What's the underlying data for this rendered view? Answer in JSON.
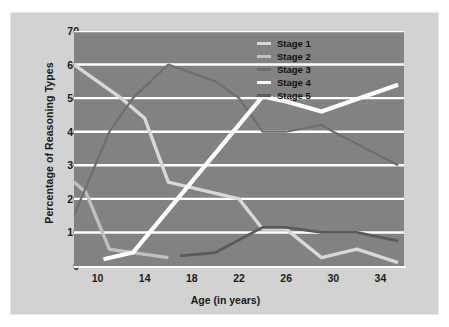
{
  "chart_data": {
    "type": "line",
    "title": "",
    "xlabel": "Age (in years)",
    "ylabel": "Percentage of Reasoning Types",
    "xlim": [
      8,
      36
    ],
    "ylim": [
      0,
      70
    ],
    "xticks": [
      10,
      14,
      18,
      22,
      26,
      30,
      34
    ],
    "yticks": [
      0,
      10,
      20,
      30,
      40,
      50,
      60,
      70
    ],
    "grid": "horizontal",
    "legend_position": "top-right",
    "series": [
      {
        "name": "Stage 1",
        "color": "#d8d8d8",
        "points": [
          [
            8,
            60
          ],
          [
            12,
            50
          ],
          [
            14,
            44
          ],
          [
            16,
            25
          ],
          [
            22,
            20
          ],
          [
            24,
            11
          ],
          [
            26,
            11
          ],
          [
            29,
            2.5
          ],
          [
            32,
            5
          ],
          [
            35.5,
            1
          ]
        ]
      },
      {
        "name": "Stage 2",
        "color": "#c0c0c0",
        "points": [
          [
            8,
            25
          ],
          [
            9,
            22
          ],
          [
            11,
            5
          ],
          [
            13,
            4
          ],
          [
            16,
            2.5
          ]
        ]
      },
      {
        "name": "Stage 3",
        "color": "#6e6e6e",
        "points": [
          [
            8,
            15
          ],
          [
            11,
            40
          ],
          [
            13,
            50
          ],
          [
            16,
            60
          ],
          [
            20,
            55
          ],
          [
            22,
            50
          ],
          [
            24,
            40
          ],
          [
            26,
            40
          ],
          [
            29,
            42
          ],
          [
            30,
            40
          ],
          [
            35.5,
            30
          ]
        ]
      },
      {
        "name": "Stage 4",
        "color": "#ffffff",
        "points": [
          [
            10.5,
            2
          ],
          [
            13,
            4
          ],
          [
            24,
            50.5
          ],
          [
            26,
            49
          ],
          [
            29,
            46
          ],
          [
            35.5,
            54
          ]
        ]
      },
      {
        "name": "Stage 5",
        "color": "#5a5a5a",
        "points": [
          [
            17,
            3
          ],
          [
            20,
            4
          ],
          [
            24,
            11.5
          ],
          [
            26,
            11.5
          ],
          [
            29,
            10
          ],
          [
            32,
            10
          ],
          [
            35.5,
            7.5
          ]
        ]
      }
    ]
  },
  "legend": {
    "items": [
      {
        "label": "Stage 1",
        "color": "#d8d8d8"
      },
      {
        "label": "Stage 2",
        "color": "#c0c0c0"
      },
      {
        "label": "Stage 3",
        "color": "#6e6e6e"
      },
      {
        "label": "Stage 4",
        "color": "#ffffff"
      },
      {
        "label": "Stage 5",
        "color": "#5a5a5a"
      }
    ]
  },
  "colors": {
    "card_background": "#d2d2d2",
    "plot_background": "#828282",
    "gridline": "#ffffff",
    "text": "#1a1a1a"
  }
}
